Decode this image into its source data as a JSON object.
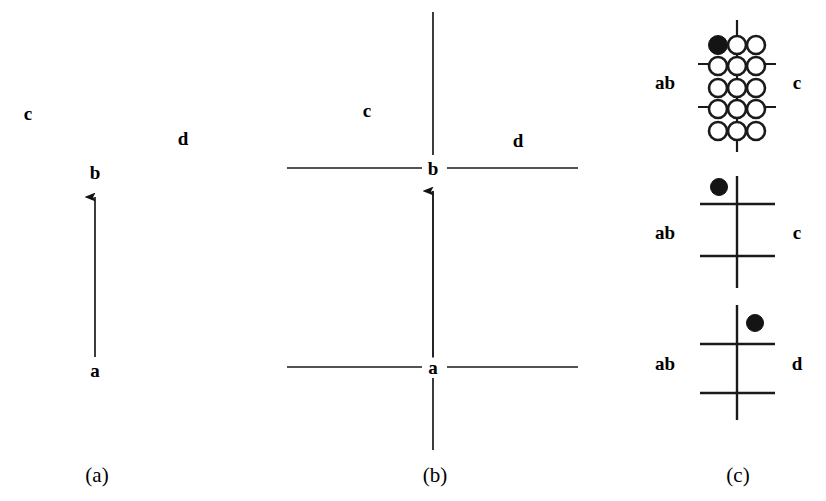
{
  "figure": {
    "width": 826,
    "height": 501,
    "background": "#ffffff",
    "ink_color": "#1a1a1a",
    "dot_fill_color": "#141414",
    "panel_count": 3
  },
  "captions": [
    {
      "text": "(a)",
      "x": 97,
      "y": 475
    },
    {
      "text": "(b)",
      "x": 435,
      "y": 475
    },
    {
      "text": "(c)",
      "x": 738,
      "y": 475
    }
  ],
  "panel_a": {
    "caption": "(a)",
    "labels": [
      {
        "name": "label-c",
        "text": "c",
        "x": 28,
        "y": 113
      },
      {
        "name": "label-d",
        "text": "d",
        "x": 183,
        "y": 138
      },
      {
        "name": "label-b",
        "text": "b",
        "x": 95,
        "y": 172
      },
      {
        "name": "label-a",
        "text": "a",
        "x": 95,
        "y": 370
      }
    ],
    "arrow": {
      "name": "arrow-a-to-b",
      "from_label": "a",
      "to_label": "b",
      "x": 95,
      "y_tail": 357,
      "y_tip": 186,
      "direction": "up"
    }
  },
  "panel_b": {
    "caption": "(b)",
    "center_x": 433,
    "labels": [
      {
        "name": "label-c",
        "text": "c",
        "x": 367,
        "y": 110
      },
      {
        "name": "label-d",
        "text": "d",
        "x": 518,
        "y": 140
      },
      {
        "name": "label-b",
        "text": "b",
        "x": 433,
        "y": 168
      },
      {
        "name": "label-a",
        "text": "a",
        "x": 433,
        "y": 367
      }
    ],
    "vertical_line": {
      "name": "vertical-axis",
      "x": 433,
      "y_top": 12,
      "y_bottom": 450
    },
    "horizontal_lines": [
      {
        "name": "horizontal-line-b",
        "y": 168,
        "x_left": 287,
        "x_right": 578
      },
      {
        "name": "horizontal-line-a",
        "y": 367,
        "x_left": 287,
        "x_right": 578
      }
    ],
    "arrow": {
      "name": "arrow-a-to-b",
      "from_label": "a",
      "to_label": "b",
      "x": 433,
      "y_tail": 358,
      "y_tip": 180,
      "direction": "up"
    }
  },
  "panel_c": {
    "caption": "(c)",
    "subdiagrams": [
      {
        "name": "lattice-diagram",
        "type": "circle-lattice",
        "left_label": "ab",
        "right_label": "c",
        "left_label_pos": {
          "x": 665,
          "y": 82
        },
        "right_label_pos": {
          "x": 797,
          "y": 82
        },
        "rows": 5,
        "columns": 3,
        "circle_radius": 9,
        "col_x": [
          718,
          737,
          756
        ],
        "row_y": [
          45,
          64,
          86,
          107,
          128
        ],
        "filled_circle": {
          "row": 0,
          "column": 0,
          "x": 718,
          "y": 45
        },
        "vertical_line": {
          "x": 737,
          "y_top": 20,
          "y_bottom": 152
        },
        "horizontal_stub_rows": [
          1,
          3
        ],
        "stub_x_left": 698,
        "stub_x_right": 776
      },
      {
        "name": "cross-diagram-upper-left-dot",
        "type": "cross",
        "left_label": "ab",
        "right_label": "c",
        "left_label_pos": {
          "x": 665,
          "y": 232
        },
        "right_label_pos": {
          "x": 797,
          "y": 232
        },
        "center_x": 737,
        "vertical_line": {
          "y_top": 176,
          "y_bottom": 288
        },
        "horizontal_lines": [
          {
            "y": 204,
            "x_left": 700,
            "x_right": 775
          },
          {
            "y": 256,
            "x_left": 700,
            "x_right": 775
          }
        ],
        "dot": {
          "x": 718,
          "y": 186,
          "radius": 8,
          "position": "upper-left"
        }
      },
      {
        "name": "cross-diagram-upper-right-dot",
        "type": "cross",
        "left_label": "ab",
        "right_label": "d",
        "left_label_pos": {
          "x": 665,
          "y": 363
        },
        "right_label_pos": {
          "x": 797,
          "y": 363
        },
        "center_x": 737,
        "vertical_line": {
          "y_top": 305,
          "y_bottom": 420
        },
        "horizontal_lines": [
          {
            "y": 344,
            "x_left": 700,
            "x_right": 775
          },
          {
            "y": 393,
            "x_left": 700,
            "x_right": 775
          }
        ],
        "dot": {
          "x": 755,
          "y": 322,
          "radius": 8,
          "position": "upper-right"
        }
      }
    ]
  }
}
